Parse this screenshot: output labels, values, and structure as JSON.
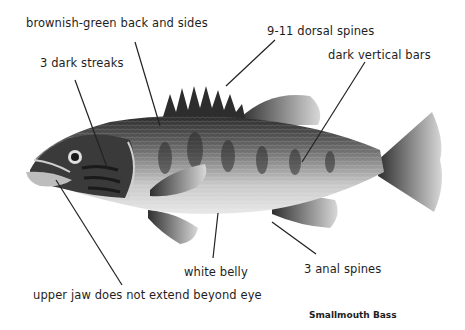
{
  "diagram": {
    "title": "Smallmouth Bass",
    "labels": [
      {
        "id": "back",
        "text": "brownish-green back and sides"
      },
      {
        "id": "dorsal",
        "text": "9-11 dorsal spines"
      },
      {
        "id": "streaks",
        "text": "3 dark streaks"
      },
      {
        "id": "bars",
        "text": "dark vertical bars"
      },
      {
        "id": "belly",
        "text": "white belly"
      },
      {
        "id": "anal",
        "text": "3 anal spines"
      },
      {
        "id": "jaw",
        "text": "upper jaw does not extend beyond eye"
      }
    ],
    "colors": {
      "line": "#222222",
      "fish_dark": "#2a2a2a",
      "fish_mid": "#8a8a8a",
      "fish_light": "#d9d9d9"
    }
  }
}
